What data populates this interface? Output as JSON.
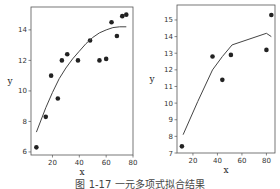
{
  "caption": "图 1-17 一元多项式拟合结果",
  "chart_data": [
    {
      "type": "scatter",
      "title": "",
      "xlabel": "x",
      "ylabel": "y",
      "xlim": [
        4,
        80
      ],
      "ylim": [
        5.8,
        15.5
      ],
      "xticks": [
        20,
        40,
        60,
        80
      ],
      "yticks": [
        6,
        8,
        10,
        12,
        14
      ],
      "grid": false,
      "series": [
        {
          "name": "data",
          "kind": "scatter",
          "color": "#222222",
          "points": [
            [
              8,
              6.3
            ],
            [
              15,
              8.3
            ],
            [
              19,
              11.0
            ],
            [
              24,
              9.5
            ],
            [
              27,
              12.0
            ],
            [
              31,
              12.4
            ],
            [
              39,
              12.0
            ],
            [
              48,
              13.3
            ],
            [
              55,
              12.0
            ],
            [
              60,
              12.1
            ],
            [
              64,
              14.5
            ],
            [
              68,
              13.6
            ],
            [
              72,
              14.9
            ],
            [
              75,
              15.0
            ]
          ]
        },
        {
          "name": "fit",
          "kind": "line",
          "color": "#444444",
          "points": [
            [
              8,
              7.3
            ],
            [
              15,
              8.9
            ],
            [
              20,
              9.9
            ],
            [
              25,
              10.8
            ],
            [
              30,
              11.5
            ],
            [
              35,
              12.1
            ],
            [
              40,
              12.6
            ],
            [
              45,
              13.1
            ],
            [
              50,
              13.5
            ],
            [
              55,
              13.8
            ],
            [
              60,
              14.0
            ],
            [
              65,
              14.15
            ],
            [
              70,
              14.2
            ],
            [
              75,
              14.2
            ]
          ]
        }
      ]
    },
    {
      "type": "scatter",
      "title": "",
      "xlabel": "x",
      "ylabel": "y",
      "xlim": [
        7,
        87
      ],
      "ylim": [
        7,
        15.9
      ],
      "xticks": [
        20,
        40,
        60,
        80
      ],
      "yticks": [
        7,
        8,
        9,
        10,
        11,
        12,
        13,
        14,
        15
      ],
      "grid": false,
      "series": [
        {
          "name": "data",
          "kind": "scatter",
          "color": "#222222",
          "points": [
            [
              11,
              7.4
            ],
            [
              36,
              12.8
            ],
            [
              44,
              11.4
            ],
            [
              51,
              12.9
            ],
            [
              80,
              13.2
            ],
            [
              84,
              15.3
            ]
          ]
        },
        {
          "name": "fit",
          "kind": "line",
          "color": "#444444",
          "points": [
            [
              12,
              8.1
            ],
            [
              24,
              10.1
            ],
            [
              36,
              12.0
            ],
            [
              44,
              12.8
            ],
            [
              52,
              13.5
            ],
            [
              80,
              14.2
            ],
            [
              84,
              14.0
            ]
          ]
        }
      ]
    }
  ]
}
